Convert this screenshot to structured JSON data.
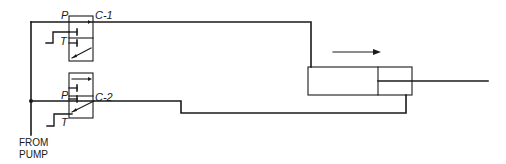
{
  "diagram": {
    "type": "hydraulic-circuit",
    "colors": {
      "line": "#1a1a1a",
      "background": "#ffffff"
    },
    "valves": [
      {
        "id": "C-1",
        "port_pressure_label": "P",
        "port_tank_label": "T",
        "output_label": "C-1"
      },
      {
        "id": "C-2",
        "port_pressure_label": "P",
        "port_tank_label": "T",
        "output_label": "C-2"
      }
    ],
    "source_label_line1": "FROM",
    "source_label_line2": "PUMP",
    "cylinder": {
      "motion_direction": "right",
      "motion_arrow": "arrow-right-icon"
    }
  }
}
